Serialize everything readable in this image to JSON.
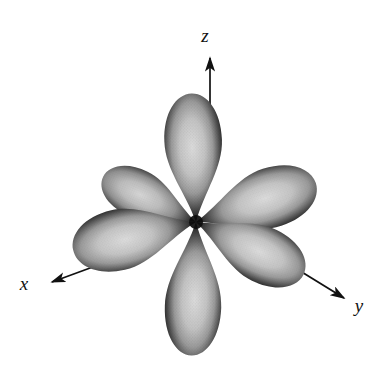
{
  "figure": {
    "background_color": "#ffffff",
    "ink_color": "#111111",
    "lobe_outline_color": "#1a1a1a",
    "lobe_fill_color": "#b4b4b4",
    "lobe_highlight_color": "#d8d8d8",
    "center": {
      "x": 196,
      "y": 222
    },
    "lobe_count": 6
  },
  "axes": [
    {
      "id": "z",
      "label": "z",
      "label_x": 211,
      "label_y": 40,
      "line_x1": 210,
      "line_y1": 108,
      "line_x2": 210,
      "line_y2": 56,
      "direction": "up",
      "arrowhead": true
    },
    {
      "id": "x",
      "label": "x",
      "label_x": 22,
      "label_y": 289,
      "line_x1": 118,
      "line_y1": 258,
      "line_x2": 49,
      "line_y2": 283,
      "direction": "down-left",
      "arrowhead": true
    },
    {
      "id": "y",
      "label": "y",
      "label_x": 357,
      "label_y": 310,
      "line_x1": 292,
      "line_y1": 267,
      "line_x2": 346,
      "line_y2": 300,
      "direction": "down-right",
      "arrowhead": true
    }
  ],
  "lobes": [
    {
      "name": "lobe-plus-z",
      "angle_deg": -90,
      "length": 128,
      "width": 56,
      "tilt_deg": 0,
      "description": "upper vertical lobe along +z"
    },
    {
      "name": "lobe-minus-z",
      "angle_deg": 90,
      "length": 132,
      "width": 54,
      "tilt_deg": 0,
      "description": "lower vertical lobe along -z"
    },
    {
      "name": "lobe-plus-y-upper",
      "angle_deg": -18,
      "length": 126,
      "width": 52,
      "tilt_deg": 0,
      "description": "upper right lobe, far end of y axis"
    },
    {
      "name": "lobe-minus-y-lower",
      "angle_deg": 26,
      "length": 118,
      "width": 52,
      "tilt_deg": 0,
      "description": "lower right lobe, near end of y axis"
    },
    {
      "name": "lobe-plus-x-upper",
      "angle_deg": -154,
      "length": 104,
      "width": 46,
      "tilt_deg": 0,
      "description": "upper left lobe, far end of x axis"
    },
    {
      "name": "lobe-minus-x-lower",
      "angle_deg": 167,
      "length": 128,
      "width": 54,
      "tilt_deg": 0,
      "description": "lower left lobe, near end of x axis"
    }
  ]
}
